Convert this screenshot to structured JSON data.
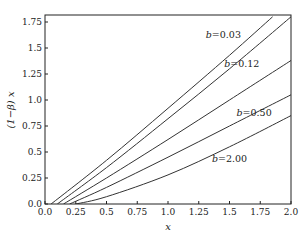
{
  "chart_data": {
    "type": "line",
    "title": "",
    "xlabel": "x",
    "ylabel": "(1−β) x",
    "xlim": [
      0.0,
      2.0
    ],
    "ylim": [
      0.0,
      1.8
    ],
    "grid": false,
    "legend": "inline labels",
    "x_ticks": [
      "0.0",
      "0.25",
      "0.5",
      "0.75",
      "1.0",
      "1.25",
      "1.5",
      "1.75",
      "2.0"
    ],
    "y_ticks": [
      "0.0",
      "0.25",
      "0.5",
      "0.75",
      "1.0",
      "1.25",
      "1.5",
      "1.75"
    ],
    "series": [
      {
        "name": "",
        "label_text": "",
        "x": [
          0.05,
          0.5,
          1.0,
          1.5,
          1.85
        ],
        "values": [
          0.0,
          0.42,
          0.92,
          1.43,
          1.8
        ]
      },
      {
        "name": "b=0.03",
        "label_text": "0.03",
        "x": [
          0.1,
          0.5,
          1.0,
          1.5,
          2.0
        ],
        "values": [
          0.0,
          0.35,
          0.82,
          1.3,
          1.8
        ]
      },
      {
        "name": "b=0.12",
        "label_text": "0.12",
        "x": [
          0.15,
          0.5,
          1.0,
          1.5,
          2.0
        ],
        "values": [
          0.0,
          0.25,
          0.62,
          1.0,
          1.38
        ]
      },
      {
        "name": "b=0.50",
        "label_text": "0.50",
        "x": [
          0.2,
          0.5,
          1.0,
          1.5,
          2.0
        ],
        "values": [
          0.0,
          0.16,
          0.45,
          0.75,
          1.05
        ]
      },
      {
        "name": "b=2.00",
        "label_text": "2.00",
        "x": [
          0.25,
          0.5,
          1.0,
          1.5,
          2.0
        ],
        "values": [
          0.0,
          0.07,
          0.28,
          0.55,
          0.85
        ]
      }
    ],
    "annotations": [
      {
        "text": "b=0.03",
        "x": 1.45,
        "y": 1.6
      },
      {
        "text": "b=0.12",
        "x": 1.6,
        "y": 1.32
      },
      {
        "text": "b=0.50",
        "x": 1.7,
        "y": 0.85
      },
      {
        "text": "b=2.00",
        "x": 1.5,
        "y": 0.4
      }
    ]
  },
  "labels": {
    "x_axis": "x",
    "y_axis": "(1−β) x",
    "b_prefix": "b",
    "eq": "="
  }
}
